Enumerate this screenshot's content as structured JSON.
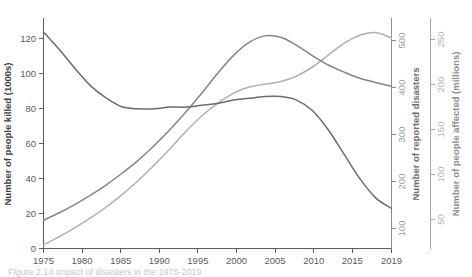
{
  "chart_data": {
    "type": "line",
    "title": "",
    "subtitle": "",
    "xlabel": "",
    "x_tick_labels": [
      "1975",
      "1980",
      "1985",
      "1990",
      "1995",
      "2000",
      "2005",
      "2010",
      "2015",
      "2019"
    ],
    "x_ticks": [
      1975,
      1980,
      1985,
      1990,
      1995,
      2000,
      2005,
      2010,
      2015,
      2019
    ],
    "xlim": [
      1975,
      2019
    ],
    "grid": false,
    "legend_position": "none",
    "axes": [
      {
        "id": "killed",
        "label": "Number of people killed (1000s)",
        "side": "left",
        "color": "#3f3f3f",
        "tick_labels": [
          "0",
          "20",
          "40",
          "60",
          "80",
          "100",
          "120"
        ],
        "ticks": [
          0,
          20,
          40,
          60,
          80,
          100,
          120
        ],
        "lim": [
          0,
          132
        ]
      },
      {
        "id": "disasters",
        "label": "Number of reported disasters",
        "side": "right",
        "color": "#6e6e6e",
        "tick_labels": [
          "100",
          "200",
          "300",
          "400",
          "500"
        ],
        "ticks": [
          100,
          200,
          300,
          400,
          500
        ],
        "lim": [
          40,
          530
        ]
      },
      {
        "id": "affected",
        "label": "Number of people affected (millions)",
        "side": "right-outer",
        "color": "#8e8e8e",
        "tick_labels": [
          "50",
          "100",
          "150",
          "200",
          "250"
        ],
        "ticks": [
          50,
          100,
          150,
          200,
          250
        ],
        "lim": [
          18,
          272
        ]
      }
    ],
    "series": [
      {
        "name": "Number of people killed (1000s)",
        "axis": "killed",
        "color": "#6b6b6b",
        "x": [
          1975,
          1977,
          1979,
          1981,
          1983,
          1985,
          1987,
          1989,
          1991,
          1993,
          1995,
          1997,
          1999,
          2001,
          2003,
          2005,
          2007,
          2009,
          2011,
          2013,
          2015,
          2017,
          2019
        ],
        "values": [
          124,
          114,
          103,
          93,
          86,
          81,
          80,
          80,
          81,
          81,
          82,
          83,
          85,
          86,
          87,
          87,
          85,
          79,
          68,
          54,
          40,
          29,
          23
        ]
      },
      {
        "name": "Number of reported disasters",
        "axis": "disasters",
        "color": "#858585",
        "x": [
          1975,
          1977,
          1979,
          1981,
          1983,
          1985,
          1987,
          1989,
          1991,
          1993,
          1995,
          1997,
          1999,
          2001,
          2003,
          2005,
          2007,
          2009,
          2011,
          2013,
          2015,
          2017,
          2019
        ],
        "values": [
          100,
          116,
          134,
          154,
          176,
          201,
          228,
          259,
          293,
          330,
          370,
          412,
          450,
          478,
          492,
          489,
          472,
          450,
          430,
          415,
          402,
          393,
          385
        ]
      },
      {
        "name": "Number of people affected (millions)",
        "axis": "affected",
        "color": "#b0b0b0",
        "x": [
          1975,
          1977,
          1979,
          1981,
          1983,
          1985,
          1987,
          1989,
          1991,
          1993,
          1995,
          1997,
          1999,
          2001,
          2003,
          2005,
          2007,
          2009,
          2011,
          2013,
          2015,
          2017,
          2019
        ],
        "values": [
          22,
          31,
          41,
          52,
          64,
          78,
          93,
          110,
          128,
          147,
          164,
          178,
          189,
          196,
          199,
          202,
          208,
          218,
          231,
          244,
          253,
          256,
          250
        ]
      }
    ],
    "caption": "Figure 2.14 Impact of disasters in the 1975-2019"
  }
}
